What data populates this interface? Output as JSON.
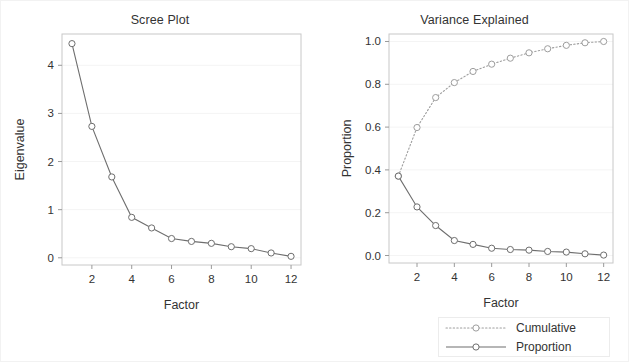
{
  "chart_data": [
    {
      "type": "line",
      "title": "Scree Plot",
      "xlabel": "Factor",
      "ylabel": "Eigenvalue",
      "x": [
        1,
        2,
        3,
        4,
        5,
        6,
        7,
        8,
        9,
        10,
        11,
        12
      ],
      "values": [
        4.45,
        2.73,
        1.68,
        0.84,
        0.62,
        0.4,
        0.34,
        0.3,
        0.23,
        0.19,
        0.1,
        0.03
      ],
      "xlim": [
        0.5,
        12.5
      ],
      "ylim": [
        -0.15,
        4.65
      ],
      "xticks": [
        2,
        4,
        6,
        8,
        10,
        12
      ],
      "xtick_labels": [
        "2",
        "4",
        "6",
        "8",
        "10",
        "12"
      ],
      "yticks": [
        0,
        1,
        2,
        3,
        4
      ],
      "ytick_labels": [
        "0",
        "1",
        "2",
        "3",
        "4"
      ],
      "grid": true,
      "legend": "none",
      "marker": "open-circle",
      "line_style": "solid"
    },
    {
      "type": "line",
      "title": "Variance Explained",
      "xlabel": "Factor",
      "ylabel": "Proportion",
      "x": [
        1,
        2,
        3,
        4,
        5,
        6,
        7,
        8,
        9,
        10,
        11,
        12
      ],
      "series": [
        {
          "name": "Cumulative",
          "line_style": "dotted",
          "values": [
            0.371,
            0.598,
            0.738,
            0.808,
            0.86,
            0.894,
            0.922,
            0.947,
            0.966,
            0.982,
            0.994,
            1.0
          ]
        },
        {
          "name": "Proportion",
          "line_style": "solid",
          "values": [
            0.371,
            0.227,
            0.14,
            0.07,
            0.052,
            0.034,
            0.028,
            0.025,
            0.019,
            0.016,
            0.008,
            0.002
          ]
        }
      ],
      "xlim": [
        0.5,
        12.5
      ],
      "ylim": [
        -0.035,
        1.035
      ],
      "xticks": [
        2,
        4,
        6,
        8,
        10,
        12
      ],
      "xtick_labels": [
        "2",
        "4",
        "6",
        "8",
        "10",
        "12"
      ],
      "yticks": [
        0.0,
        0.2,
        0.4,
        0.6,
        0.8,
        1.0
      ],
      "ytick_labels": [
        "0.0",
        "0.2",
        "0.4",
        "0.6",
        "0.8",
        "1.0"
      ],
      "grid": true,
      "legend": "bottom-right",
      "marker": "open-circle"
    }
  ],
  "left_panel": {
    "title": "Scree Plot",
    "x_axis_title": "Factor",
    "y_axis_title": "Eigenvalue"
  },
  "right_panel": {
    "title": "Variance Explained",
    "x_axis_title": "Factor",
    "y_axis_title": "Proportion"
  },
  "legend": {
    "entries": [
      {
        "label": "Cumulative",
        "style": "dotted"
      },
      {
        "label": "Proportion",
        "style": "solid"
      }
    ]
  },
  "colors": {
    "background": "#ffffff",
    "frame": "#c8c8c8",
    "gridline": "#f4f4f4",
    "series_solid": "#6e6e6e",
    "series_dotted": "#9e9e9e",
    "text": "#333333"
  }
}
